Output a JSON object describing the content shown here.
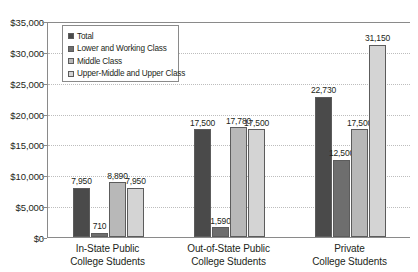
{
  "chart_data": {
    "type": "bar",
    "title": "",
    "subtitle": "",
    "xlabel": "",
    "ylabel": "",
    "categories": [
      "In-State Public College Students",
      "Out-of-State Public College Students",
      "Private College Students"
    ],
    "category_lines": [
      [
        "In-State Public",
        "College Students"
      ],
      [
        "Out-of-State Public",
        "College Students"
      ],
      [
        "Private",
        "College Students"
      ]
    ],
    "series": [
      {
        "name": "Total",
        "color": "#4a4a4a",
        "values": [
          7950,
          17500,
          22730
        ]
      },
      {
        "name": "Lower and Working Class",
        "color": "#6e6e6e",
        "values": [
          710,
          1590,
          12500
        ]
      },
      {
        "name": "Middle Class",
        "color": "#b8b8b8",
        "values": [
          8890,
          17780,
          17500
        ]
      },
      {
        "name": "Upper-Middle and Upper Class",
        "color": "#d4d4d4",
        "values": [
          7950,
          17500,
          31150
        ]
      }
    ],
    "value_labels": [
      [
        "7,950",
        "710",
        "8,890",
        "7,950"
      ],
      [
        "17,500",
        "1,590",
        "17,780",
        "17,500"
      ],
      [
        "22,730",
        "12,500",
        "17,500",
        "31,150"
      ]
    ],
    "ylim": [
      0,
      35000
    ],
    "ytick_values": [
      0,
      5000,
      10000,
      15000,
      20000,
      25000,
      30000,
      35000
    ],
    "ytick_labels": [
      "$0",
      "$5,000",
      "$10,000",
      "$15,000",
      "$20,000",
      "$25,000",
      "$30,000",
      "$35,000"
    ],
    "grid": true,
    "grid_style": "dotted",
    "legend_position": "upper-left-inside",
    "legend_entries": [
      "Total",
      "Lower and Working Class",
      "Middle Class",
      "Upper-Middle and Upper Class"
    ],
    "axis_color": "#8a8a8a",
    "text_color": "#231f20",
    "background": "#ffffff"
  }
}
